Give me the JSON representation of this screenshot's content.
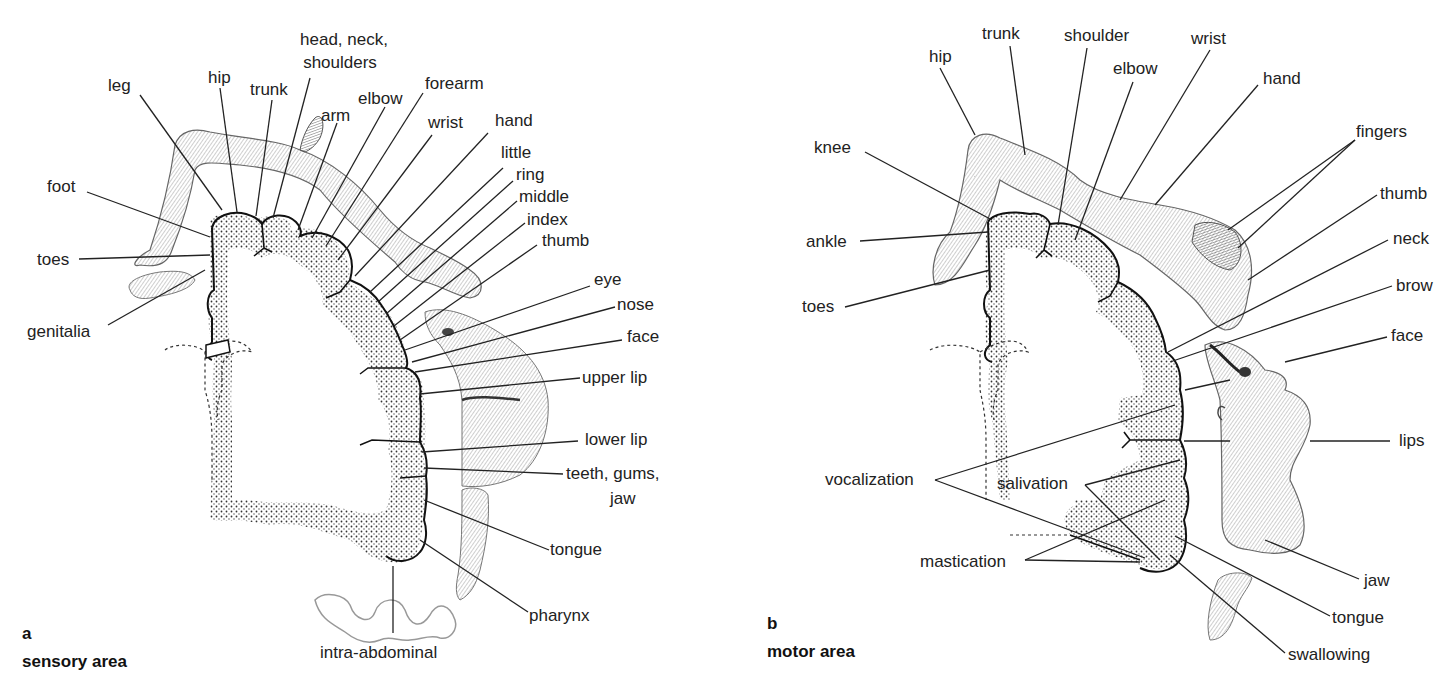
{
  "panels": [
    {
      "letter": "a",
      "title": "sensory area",
      "labels": {
        "leg": "leg",
        "hip": "hip",
        "trunk": "trunk",
        "head_neck_shoulders_1": "head, neck,",
        "head_neck_shoulders_2": "shoulders",
        "arm": "arm",
        "elbow": "elbow",
        "forearm": "forearm",
        "wrist": "wrist",
        "hand": "hand",
        "little": "little",
        "ring": "ring",
        "middle": "middle",
        "index": "index",
        "thumb": "thumb",
        "eye": "eye",
        "nose": "nose",
        "face": "face",
        "upper_lip": "upper lip",
        "lower_lip": "lower lip",
        "teeth_1": "teeth, gums,",
        "teeth_2": "jaw",
        "tongue": "tongue",
        "pharynx": "pharynx",
        "intra_abdominal": "intra-abdominal",
        "foot": "foot",
        "toes": "toes",
        "genitalia": "genitalia"
      }
    },
    {
      "letter": "b",
      "title": "motor area",
      "labels": {
        "hip": "hip",
        "trunk": "trunk",
        "shoulder": "shoulder",
        "elbow": "elbow",
        "wrist": "wrist",
        "hand": "hand",
        "fingers": "fingers",
        "thumb": "thumb",
        "neck": "neck",
        "brow": "brow",
        "face": "face",
        "lips": "lips",
        "jaw": "jaw",
        "tongue": "tongue",
        "swallowing": "swallowing",
        "knee": "knee",
        "ankle": "ankle",
        "toes": "toes",
        "vocalization": "vocalization",
        "salivation": "salivation",
        "mastication": "mastication"
      }
    }
  ]
}
